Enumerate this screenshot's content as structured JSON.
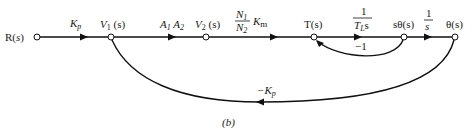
{
  "diagram": {
    "type": "signal-flow-graph",
    "caption": "(b)",
    "nodes": [
      {
        "id": "R",
        "label_main": "R(",
        "label_var": "s",
        "label_end": ")",
        "x": 37,
        "y": 37
      },
      {
        "id": "V1",
        "label_main": "V",
        "label_sub": "1",
        "label_end": " (s)",
        "x": 111,
        "y": 37
      },
      {
        "id": "V2",
        "label_main": "V",
        "label_sub": "2",
        "label_end": " (s)",
        "x": 206,
        "y": 37
      },
      {
        "id": "T",
        "label_main": "T(s)",
        "x": 314,
        "y": 37
      },
      {
        "id": "stheta",
        "label_main": "sθ(s)",
        "x": 404,
        "y": 37
      },
      {
        "id": "theta",
        "label_main": "θ(s)",
        "x": 455,
        "y": 37
      }
    ],
    "branches": [
      {
        "from": "R",
        "to": "V1",
        "gain": "K",
        "gain_sub": "p"
      },
      {
        "from": "V1",
        "to": "V2",
        "gain": "A",
        "gain_sub": "1",
        "gain2": "A",
        "gain2_sub": "2"
      },
      {
        "from": "V2",
        "to": "T",
        "gain_num": "N",
        "gain_num_sub": "1",
        "gain_den": "N",
        "gain_den_sub": "2",
        "gain_tail": "K",
        "gain_tail_sub": "m"
      },
      {
        "from": "T",
        "to": "stheta",
        "gain_num": "1",
        "gain_den": "T",
        "gain_den_sub": "L",
        "gain_den_tail": "s"
      },
      {
        "from": "stheta",
        "to": "theta",
        "gain_num": "1",
        "gain_den": "s"
      },
      {
        "from": "stheta",
        "to": "T",
        "gain": "−1",
        "kind": "feedback"
      },
      {
        "from": "theta",
        "to": "V1",
        "gain": "−K",
        "gain_sub": "p",
        "kind": "feedback"
      }
    ]
  }
}
